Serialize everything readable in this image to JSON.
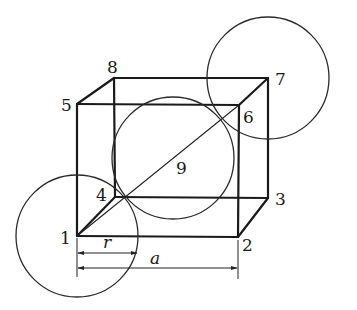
{
  "diagram": {
    "type": "unit-cell-cube",
    "vertices": [
      {
        "id": "1",
        "label": "1",
        "x": 77,
        "y": 236,
        "lx": 60,
        "ly": 244
      },
      {
        "id": "2",
        "label": "2",
        "x": 238,
        "y": 237,
        "lx": 242,
        "ly": 250
      },
      {
        "id": "3",
        "label": "3",
        "x": 268,
        "y": 198,
        "lx": 275,
        "ly": 205
      },
      {
        "id": "4",
        "label": "4",
        "x": 115,
        "y": 197,
        "lx": 96,
        "ly": 200
      },
      {
        "id": "5",
        "label": "5",
        "x": 77,
        "y": 104,
        "lx": 61,
        "ly": 111
      },
      {
        "id": "6",
        "label": "6",
        "x": 239,
        "y": 105,
        "lx": 243,
        "ly": 123
      },
      {
        "id": "7",
        "label": "7",
        "x": 268,
        "y": 78,
        "lx": 275,
        "ly": 85
      },
      {
        "id": "8",
        "label": "8",
        "x": 114,
        "y": 78,
        "lx": 107,
        "ly": 73
      }
    ],
    "center": {
      "label": "9",
      "x": 173,
      "y": 158,
      "lx": 176,
      "ly": 174
    },
    "circles": [
      {
        "name": "corner-atom-1",
        "cx": 77,
        "cy": 236,
        "r": 61
      },
      {
        "name": "center-atom-9",
        "cx": 173,
        "cy": 158,
        "r": 61
      },
      {
        "name": "corner-atom-7",
        "cx": 268,
        "cy": 78,
        "r": 61
      }
    ],
    "dimensions": {
      "r_label": "r",
      "a_label": "a"
    }
  }
}
